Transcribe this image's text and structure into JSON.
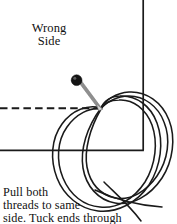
{
  "figure": {
    "width": 177,
    "height": 224,
    "background_color": "#ffffff",
    "ink_color": "#1a1a1a",
    "pin_head_color": "#111111",
    "pin_shaft_color": "#8a8a8a"
  },
  "labels": {
    "wrong_side": {
      "lines": [
        "Wrong",
        "Side"
      ],
      "line1": "Wrong",
      "line2": "Side"
    },
    "instruction": {
      "lines": [
        "Pull both",
        "threads to same",
        "side. Tuck ends through"
      ],
      "line1": "Pull both",
      "line2": "threads to same",
      "line3": "side. Tuck ends through"
    }
  },
  "elements": {
    "fabric_edge_vertical": "vertical fabric edge line",
    "fabric_edge_horizontal": "horizontal fabric edge line",
    "fold_guide_dashed": "dashed fold guide line",
    "pin": "straight pin with round head",
    "thread_loop_outer": "outer thread loop",
    "thread_loop_inner": "inner thread loop",
    "thread_tails": "thread tail ends"
  }
}
